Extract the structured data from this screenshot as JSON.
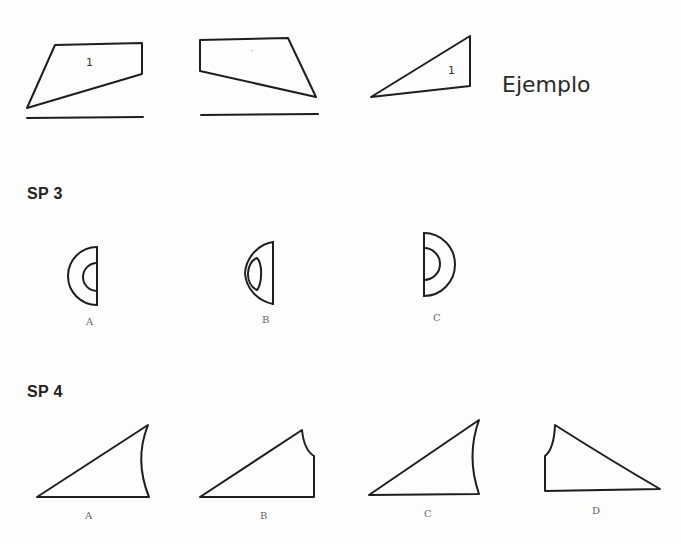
{
  "example_row": {
    "label": "Ejemplo",
    "shapes": [
      {
        "name": "example-shape-1",
        "number": "1"
      },
      {
        "name": "example-shape-2",
        "number": "·"
      },
      {
        "name": "example-shape-3",
        "number": "1"
      }
    ]
  },
  "sp3": {
    "title": "SP 3",
    "options": [
      {
        "label": "A"
      },
      {
        "label": "B"
      },
      {
        "label": "C"
      }
    ]
  },
  "sp4": {
    "title": "SP 4",
    "options": [
      {
        "label": "A"
      },
      {
        "label": "B"
      },
      {
        "label": "C"
      },
      {
        "label": "D"
      }
    ]
  },
  "colors": {
    "stroke": "#1e1e1e",
    "background": "#fdfdfc",
    "label_gray": "#666666"
  }
}
